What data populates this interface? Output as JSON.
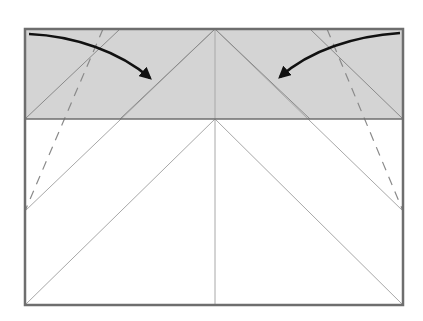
{
  "diagram": {
    "type": "origami-fold-instruction",
    "colors": {
      "background": "#ffffff",
      "paper_fill": "#ffffff",
      "shaded_flap": "#d4d4d4",
      "frame_stroke": "#6e6e6e",
      "crease_stroke": "#a8a8a8",
      "dashed_stroke": "#8a8a8a",
      "arrow": "#111111"
    },
    "frame": {
      "x": 25,
      "y": 29,
      "width": 378,
      "height": 276
    },
    "shaded_band": {
      "x": 25,
      "y": 29,
      "width": 378,
      "height": 90
    },
    "arrows": [
      {
        "name": "left-fold-arrow",
        "direction": "fold-inward-right"
      },
      {
        "name": "right-fold-arrow",
        "direction": "fold-inward-left"
      }
    ]
  }
}
